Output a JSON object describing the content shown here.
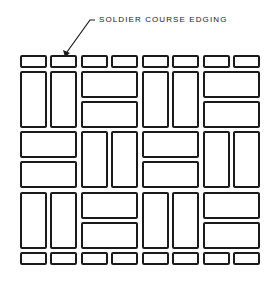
{
  "annotation": {
    "label": "SOLDIER COURSE EDGING",
    "points_to": "top soldier course, brick 2"
  },
  "pattern": {
    "name": "basketweave",
    "columns": 8,
    "soldier_course_rows": [
      "top",
      "bottom"
    ],
    "rows": [
      [
        "V",
        "V",
        "HH",
        "V",
        "V",
        "HH"
      ],
      [
        "HH",
        "V",
        "V",
        "HH",
        "V",
        "V"
      ],
      [
        "V",
        "V",
        "HH",
        "V",
        "V",
        "HH"
      ]
    ]
  },
  "colors": {
    "stroke": "#1a1a1a",
    "background": "#ffffff"
  }
}
